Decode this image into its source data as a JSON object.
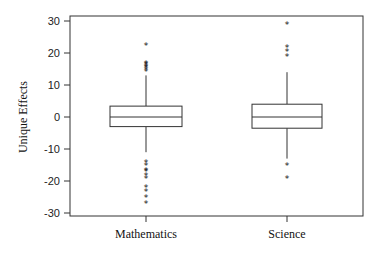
{
  "chart_data": {
    "type": "boxplot",
    "title": "",
    "xlabel": "",
    "ylabel": "Unique Effects",
    "ylim": [
      -30,
      30
    ],
    "yticks": [
      30,
      20,
      10,
      0,
      -10,
      -20,
      -30
    ],
    "grid": false,
    "legend": null,
    "categories": [
      "Mathematics",
      "Science"
    ],
    "series": [
      {
        "name": "Mathematics",
        "q1": -3,
        "median": 0,
        "q3": 3.4,
        "whisker_low": -11,
        "whisker_high": 13,
        "outliers": [
          22.5,
          17,
          16.5,
          16,
          15.5,
          15,
          14.5,
          -14,
          -15,
          -16.5,
          -17,
          -18,
          -19,
          -22,
          -23,
          -25,
          -27
        ]
      },
      {
        "name": "Science",
        "q1": -3.5,
        "median": 0,
        "q3": 4,
        "whisker_low": -13,
        "whisker_high": 14,
        "outliers": [
          29,
          22,
          20.5,
          19,
          -15,
          -19
        ]
      }
    ]
  }
}
